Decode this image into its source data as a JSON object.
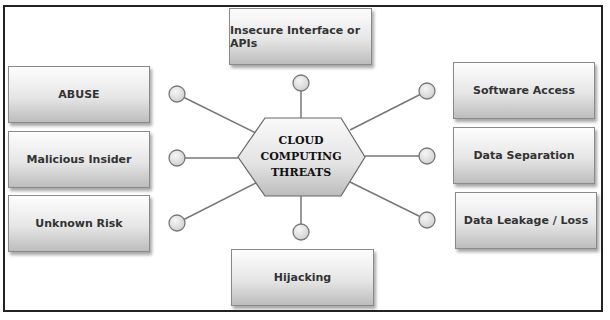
{
  "center": {
    "lines": [
      "CLOUD",
      "COMPUTING",
      "THREATS"
    ]
  },
  "threats": {
    "top": "Insecure Interface or APIs",
    "left": [
      "ABUSE",
      "Malicious Insider",
      "Unknown Risk"
    ],
    "right": [
      "Software Access",
      "Data Separation",
      "Data Leakage / Loss"
    ],
    "bottom": "Hijacking"
  },
  "colors": {
    "border": "#222222",
    "box_light": "#fdfdfd",
    "box_dark": "#bdbdbd",
    "connector": "#777777",
    "node_fill": "#e2e2e2"
  }
}
